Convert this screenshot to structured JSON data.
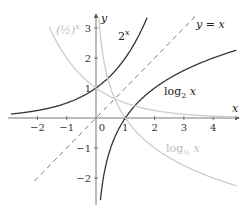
{
  "chart_data": {
    "type": "line",
    "title": "",
    "xlabel": "x",
    "ylabel": "y",
    "xlim": [
      -2.9,
      4.8
    ],
    "ylim": [
      -2.9,
      3.5
    ],
    "grid": false,
    "x_ticks": [
      -2,
      -1,
      0,
      1,
      2,
      3,
      4
    ],
    "x_tick_labels": [
      "−2",
      "−1",
      "0",
      "1",
      "2",
      "3",
      "4"
    ],
    "y_ticks": [
      -2,
      -1,
      1,
      2,
      3
    ],
    "y_tick_labels": [
      "−2",
      "−1",
      "1",
      "2",
      "3"
    ],
    "series": [
      {
        "name": "2^x",
        "label": "2",
        "label_sup": "x",
        "style": "solid",
        "color": "#333333",
        "expr": "2^x"
      },
      {
        "name": "log2 x",
        "label": "log",
        "label_sub": "2",
        "label_var": " x",
        "style": "solid",
        "color": "#333333",
        "expr": "log2(x)"
      },
      {
        "name": "y = x",
        "label": "y = x",
        "style": "dashed",
        "color": "#555555",
        "expr": "x"
      },
      {
        "name": "(1/2)^x",
        "label": "(½)",
        "label_sup": "x",
        "style": "solid",
        "color": "#cccccc",
        "expr": "(1/2)^x"
      },
      {
        "name": "log1/2 x",
        "label": "log",
        "label_sub": "½",
        "label_var": " x",
        "style": "solid",
        "color": "#cccccc",
        "expr": "log_{1/2}(x)"
      }
    ]
  }
}
